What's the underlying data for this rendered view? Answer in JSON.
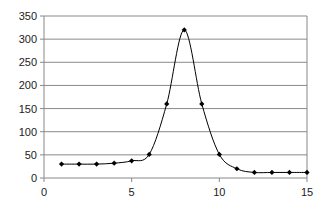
{
  "chart_data": {
    "type": "line",
    "title": "",
    "xlabel": "",
    "ylabel": "",
    "x": [
      1,
      2,
      3,
      4,
      5,
      6,
      7,
      8,
      9,
      10,
      11,
      12,
      13,
      14,
      15
    ],
    "series": [
      {
        "name": "Series 1",
        "values": [
          30,
          30,
          30,
          32,
          37,
          51,
          160,
          320,
          160,
          51,
          20,
          12,
          12,
          12,
          12
        ],
        "smooth": true,
        "marker": "diamond",
        "color": "#000000"
      }
    ],
    "xlim": [
      0,
      15
    ],
    "ylim": [
      0,
      350
    ],
    "xticks": [
      0,
      5,
      10,
      15
    ],
    "yticks": [
      0,
      50,
      100,
      150,
      200,
      250,
      300,
      350
    ],
    "xtick_labels": [
      "0",
      "5",
      "10",
      "15"
    ],
    "ytick_labels": [
      "0",
      "50",
      "100",
      "150",
      "200",
      "250",
      "300",
      "350"
    ],
    "grid": {
      "horizontal": true,
      "vertical": false,
      "color": "#888888"
    },
    "legend": null
  },
  "plot": {
    "left": 44,
    "right": 307,
    "top": 16,
    "bottom": 178
  },
  "colors": {
    "axis": "#888888",
    "grid": "#8a8a8a",
    "line": "#000000",
    "marker": "#000000"
  }
}
